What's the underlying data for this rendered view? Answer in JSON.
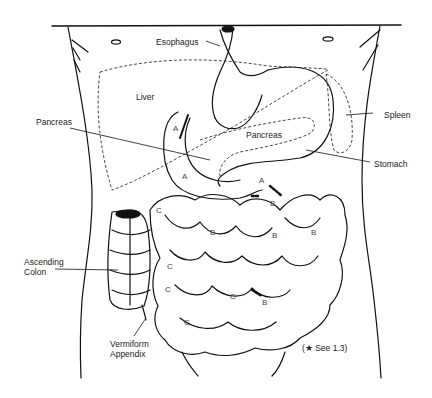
{
  "diagram": {
    "labels": {
      "esophagus": "Esophagus",
      "liver": "Liver",
      "pancreas_left": "Pancreas",
      "pancreas_inner": "Pancreas",
      "spleen": "Spleen",
      "stomach": "Stomach",
      "ascending_colon": "Ascending\nColon",
      "appendix": "Vermiform\nAppendix",
      "footnote": "(★ See 1.3)"
    },
    "segment_markers": {
      "A": [
        "A",
        "A",
        "A"
      ],
      "B": [
        "B",
        "B",
        "B",
        "B",
        "B"
      ],
      "C": [
        "C",
        "C",
        "C",
        "C",
        "C"
      ]
    },
    "colors": {
      "line": "#111111",
      "dashed": "#333333",
      "background": "#ffffff"
    }
  }
}
